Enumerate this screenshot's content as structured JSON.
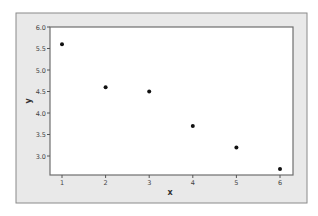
{
  "chart_data": {
    "type": "scatter",
    "title": "",
    "xlabel": "x",
    "ylabel": "y",
    "x": [
      1,
      2,
      3,
      4,
      5,
      6
    ],
    "y": [
      5.6,
      4.6,
      4.5,
      3.7,
      3.2,
      2.7
    ],
    "xlim": [
      0.72,
      6.3
    ],
    "ylim": [
      2.56,
      6.0
    ],
    "xticks": [
      "1",
      "2",
      "3",
      "4",
      "5",
      "6"
    ],
    "yticks": [
      "3.0",
      "3.5",
      "4.0",
      "4.5",
      "5.0",
      "5.5",
      "6.0"
    ],
    "grid": false,
    "legend": null
  },
  "colors": {
    "outer_background": "#e9e9e9",
    "plot_background": "#ffffff",
    "frame": "#6e6e6e",
    "marker": "#111111",
    "text": "#333333"
  }
}
